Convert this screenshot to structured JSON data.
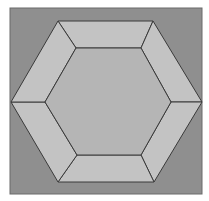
{
  "figure": {
    "colors": {
      "background": "#ffffff",
      "square_fill": "#8f8f8f",
      "square_stroke": "#6a6a6a",
      "trapezoid_fill": "#c3c3c3",
      "inner_hexagon_fill": "#b5b5b5",
      "edge_stroke": "#3a3a3a"
    },
    "square": {
      "x": 10,
      "y": 8,
      "w": 192,
      "h": 186
    },
    "outer_hexagon": [
      [
        58,
        21
      ],
      [
        153,
        21
      ],
      [
        202,
        102
      ],
      [
        154,
        182
      ],
      [
        58,
        182
      ],
      [
        11,
        102
      ]
    ],
    "inner_hexagon": [
      [
        76,
        48
      ],
      [
        141,
        48
      ],
      [
        171,
        102
      ],
      [
        141,
        155
      ],
      [
        77,
        155
      ],
      [
        45,
        102
      ]
    ]
  }
}
